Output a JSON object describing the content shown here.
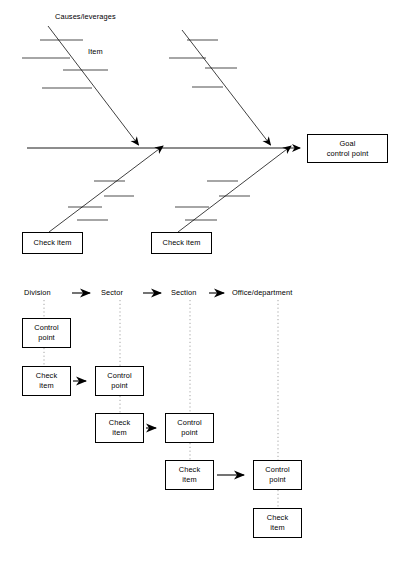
{
  "figure": {
    "type": "diagram",
    "kind": "fishbone-and-deployment-flow",
    "colors": {
      "line": "#000000",
      "background": "#ffffff",
      "text": "#000000",
      "dotted": "#9a9a9a"
    }
  },
  "fishbone": {
    "annotations": [
      {
        "name": "causes-leverages-label",
        "text": "Causes/leverages",
        "x": 55,
        "y": 18
      },
      {
        "name": "item-label",
        "text": "Item",
        "x": 88,
        "y": 53
      }
    ],
    "goal_box": {
      "line1": "Goal",
      "line2": "control point",
      "x": 307,
      "y": 134,
      "w": 81,
      "h": 29
    },
    "check_boxes": [
      {
        "line1": "Check item",
        "x": 22,
        "y": 232,
        "w": 61,
        "h": 22
      },
      {
        "line1": "Check item",
        "x": 151,
        "y": 232,
        "w": 61,
        "h": 22
      }
    ],
    "spine": {
      "x1": 27,
      "y1": 148,
      "x2": 306,
      "y2": 148
    },
    "upper_bones": [
      {
        "x1": 48,
        "y1": 26,
        "x2": 140,
        "y2": 148
      },
      {
        "x1": 182,
        "y1": 30,
        "x2": 272,
        "y2": 148
      }
    ],
    "lower_bones": [
      {
        "x1": 49,
        "y1": 232,
        "x2": 140,
        "y2": 148
      },
      {
        "x1": 178,
        "y1": 232,
        "x2": 272,
        "y2": 148
      }
    ],
    "tick_count_per_bone": 4
  },
  "flow": {
    "header": {
      "stages": [
        "Division",
        "Sector",
        "Section",
        "Office/department"
      ],
      "arrow_glyph": "arrow-right",
      "y": 294
    },
    "columns_x": [
      44,
      120,
      190,
      278
    ],
    "nodes": [
      {
        "col": 0,
        "type": "control-point",
        "line1": "Control",
        "line2": "point",
        "x": 22,
        "y": 318,
        "w": 49,
        "h": 30
      },
      {
        "col": 0,
        "type": "check-item",
        "line1": "Check",
        "line2": "item",
        "x": 22,
        "y": 366,
        "w": 49,
        "h": 30
      },
      {
        "col": 1,
        "type": "control-point",
        "line1": "Control",
        "line2": "point",
        "x": 95,
        "y": 366,
        "w": 49,
        "h": 30
      },
      {
        "col": 1,
        "type": "check-item",
        "line1": "Check",
        "line2": "item",
        "x": 95,
        "y": 413,
        "w": 49,
        "h": 30
      },
      {
        "col": 2,
        "type": "control-point",
        "line1": "Control",
        "line2": "point",
        "x": 165,
        "y": 413,
        "w": 49,
        "h": 30
      },
      {
        "col": 2,
        "type": "check-item",
        "line1": "Check",
        "line2": "item",
        "x": 165,
        "y": 460,
        "w": 49,
        "h": 30
      },
      {
        "col": 3,
        "type": "control-point",
        "line1": "Control",
        "line2": "point",
        "x": 253,
        "y": 460,
        "w": 49,
        "h": 30
      },
      {
        "col": 3,
        "type": "check-item",
        "line1": "Check",
        "line2": "item",
        "x": 253,
        "y": 508,
        "w": 49,
        "h": 30
      }
    ],
    "connector_arrows": [
      {
        "from": "col0-check-item",
        "to": "col1-control-point",
        "x1": 73,
        "y1": 381,
        "x2": 93,
        "y2": 381
      },
      {
        "from": "col1-check-item",
        "to": "col2-control-point",
        "x1": 146,
        "y1": 428,
        "x2": 163,
        "y2": 428
      },
      {
        "from": "col2-check-item",
        "to": "col3-control-point",
        "x1": 217,
        "y1": 475,
        "x2": 251,
        "y2": 475
      }
    ]
  }
}
